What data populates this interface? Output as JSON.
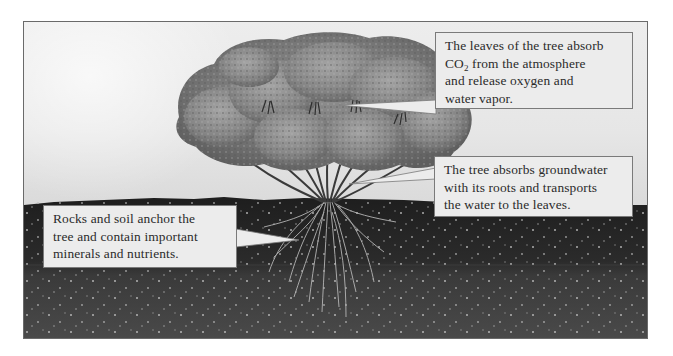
{
  "diagram": {
    "type": "labeled illustration",
    "colors": {
      "sky": "#e6e6e6",
      "soil": "#2a2a2a",
      "callout_bg": "#ececec",
      "callout_border": "#7a7a7a",
      "text": "#2a2a2a"
    }
  },
  "callouts": {
    "leaves": {
      "line1": "The leaves of the tree absorb",
      "line2_prefix": "CO",
      "line2_sub": "2",
      "line2_suffix": " from the atmosphere",
      "line3": "and release oxygen and",
      "line4": "water vapor.",
      "points_to": "tree canopy leaves"
    },
    "roots": {
      "line1": "The tree absorbs groundwater",
      "line2": "with its roots and transports",
      "line3": "the water to the leaves.",
      "points_to": "tree trunk / branches"
    },
    "soil": {
      "line1": "Rocks and soil anchor the",
      "line2": "tree and contain important",
      "line3": "minerals and nutrients.",
      "points_to": "roots in soil"
    }
  }
}
